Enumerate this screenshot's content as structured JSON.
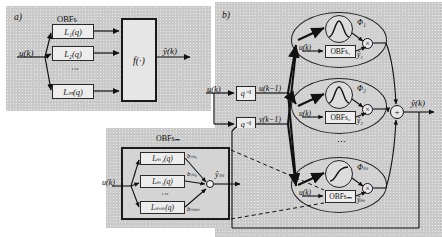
{
  "figure": {
    "panel_a": {
      "tag": "a)",
      "obfs_title": "OBFs",
      "input_label": "u(k)",
      "output_label": "ŷ(k)",
      "nonlinearity_label": "f(·)",
      "vertical_dots": "⋮",
      "filters": [
        {
          "name": "L1",
          "label": "L₁(q)"
        },
        {
          "name": "L2",
          "label": "L₂(q)"
        },
        {
          "name": "Lm",
          "label": "Lₘ(q)"
        }
      ]
    },
    "panel_b": {
      "tag": "b)",
      "input_label": "u(k)",
      "output_label": "ŷ(k)",
      "sum_symbol": "+",
      "vertical_dots": "⋮",
      "delays": [
        {
          "name": "delay-u",
          "block_label": "q⁻¹",
          "output_label": "u(k−1)"
        },
        {
          "name": "delay-y",
          "block_label": "q⁻¹",
          "output_label": "y(k−1)"
        }
      ],
      "local_models": [
        {
          "name": "local-model-1",
          "validity_label": "Φ₁",
          "validity_shape": "gaussian",
          "obfs_label": "OBFs₁",
          "local_input_label": "u(k)",
          "local_output_label": "ŷ₁",
          "product_symbol": "×"
        },
        {
          "name": "local-model-2",
          "validity_label": "Φ₂",
          "validity_shape": "gaussian",
          "obfs_label": "OBFs₂",
          "local_input_label": "u(k)",
          "local_output_label": "ŷ₂",
          "product_symbol": "×"
        },
        {
          "name": "local-model-M",
          "validity_label": "Φₘ",
          "validity_shape": "sigmoid",
          "obfs_label": "OBFsₘ",
          "local_input_label": "u(k)",
          "local_output_label": "ŷₘ",
          "product_symbol": "×"
        }
      ]
    },
    "panel_detail": {
      "title": "OBFsₘ",
      "input_label": "u(k)",
      "output_label": "ŷₘ",
      "sum_symbol": "○",
      "vertical_dots": "⋮",
      "filters": [
        {
          "name": "LM1",
          "label": "Lₘ₁(q)",
          "weight_label": "bₘ₁"
        },
        {
          "name": "LM2",
          "label": "Lₘ₂(q)",
          "weight_label": "bₘ₂"
        },
        {
          "name": "LMm",
          "label": "Lₘₘ(q)",
          "weight_label": "bₘₘ"
        }
      ]
    },
    "colors": {
      "panel_background": "#c9c9c9",
      "box_fill": "#ededed",
      "stroke": "#222222",
      "page_background": "#ffffff"
    }
  }
}
